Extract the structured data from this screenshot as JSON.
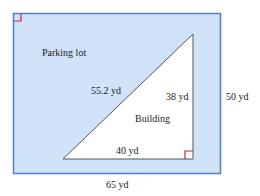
{
  "diagram": {
    "regions": {
      "outer": "Parking lot",
      "inner": "Building"
    },
    "dimensions": {
      "hypotenuse": "55.2 yd",
      "triangle_height": "38 yd",
      "triangle_base": "40 yd",
      "lot_height": "50 yd",
      "lot_width": "65 yd"
    },
    "colors": {
      "lot_fill": "#cfe2f8",
      "lot_border": "#4f7fc4",
      "triangle_fill": "#ffffff",
      "triangle_stroke": "#555555",
      "right_angle_marker": "#cc2233"
    }
  }
}
